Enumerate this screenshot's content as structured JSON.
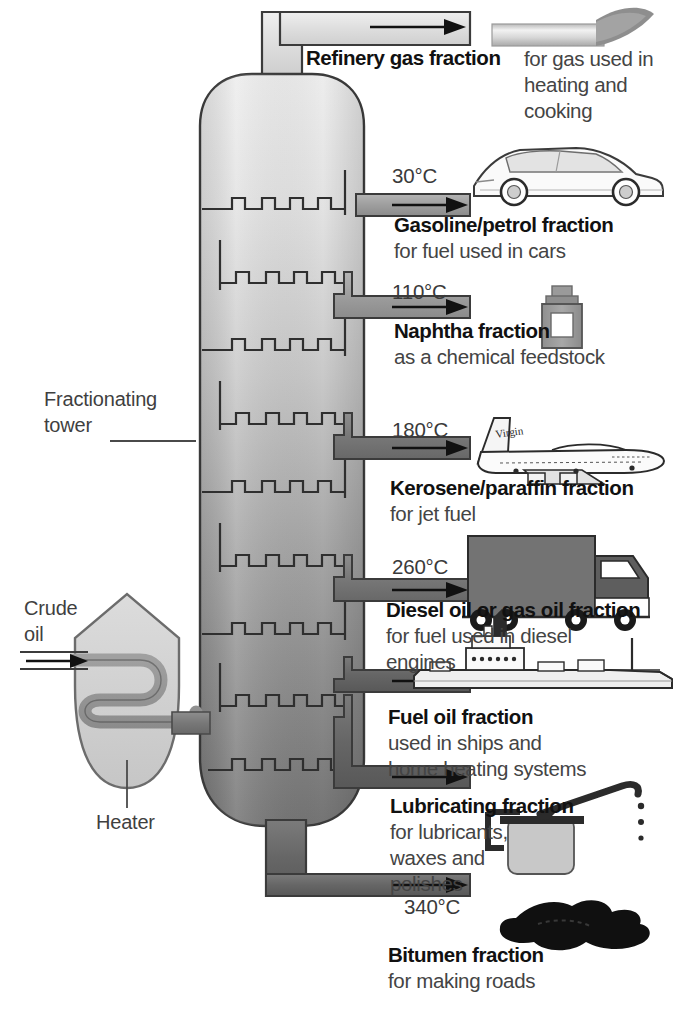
{
  "diagram": {
    "tower_label": "Fractionating\ntower",
    "tower_label_line1": "Fractionating",
    "tower_label_line2": "tower",
    "heater_label": "Heater",
    "crude_label_line1": "Crude",
    "crude_label_line2": "oil",
    "colors": {
      "tower_top": "#e9e9e9",
      "tower_bottom": "#767676",
      "outline": "#3b3b3b",
      "pipe_light": "#d8d8d8",
      "pipe_dark": "#6e6e6e",
      "text": "#2b2b2b",
      "heading": "#111111",
      "background": "#ffffff"
    }
  },
  "fractions": [
    {
      "id": "refinery-gas",
      "temp": "",
      "name": "Refinery gas fraction",
      "desc_lines": [
        "for gas used in",
        "heating and",
        "cooking"
      ],
      "icon": "gas-burner-flame-icon"
    },
    {
      "id": "gasoline",
      "temp": "30°C",
      "name": "Gasoline/petrol fraction",
      "desc_lines": [
        "for fuel used in cars"
      ],
      "icon": "car-icon"
    },
    {
      "id": "naphtha",
      "temp": "110°C",
      "name": "Naphtha fraction",
      "desc_lines": [
        "as a chemical feedstock"
      ],
      "icon": "chemical-bottle-icon"
    },
    {
      "id": "kerosene",
      "temp": "180°C",
      "name": "Kerosene/paraffin fraction",
      "desc_lines": [
        "for jet fuel"
      ],
      "icon": "airplane-icon"
    },
    {
      "id": "diesel",
      "temp": "260°C",
      "name": "Diesel oil or gas oil fraction",
      "desc_lines": [
        "for fuel used in diesel",
        "engines"
      ],
      "icon": "truck-icon"
    },
    {
      "id": "fuel-oil",
      "temp": "",
      "name": "Fuel oil fraction",
      "desc_lines": [
        "used in ships and",
        "home heating systems"
      ],
      "icon": "ship-icon"
    },
    {
      "id": "lubricating",
      "temp": "",
      "name": "Lubricating fraction",
      "desc_lines": [
        "for lubricants,",
        "waxes and",
        "polishes"
      ],
      "icon": "oil-can-icon"
    },
    {
      "id": "bitumen",
      "temp": "340°C",
      "name": "Bitumen fraction",
      "desc_lines": [
        "for making roads"
      ],
      "icon": "bitumen-puddle-icon"
    }
  ]
}
